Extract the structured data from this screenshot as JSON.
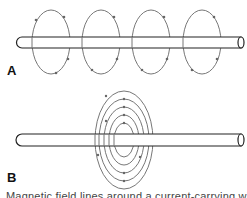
{
  "figure": {
    "panel_a": {
      "label": "A",
      "description": "Straight wire with four separate circular magnetic field loops spaced along its length",
      "loop_count": 4
    },
    "panel_b": {
      "label": "B",
      "description": "Straight wire with concentric magnetic field loops centered at one point",
      "loop_count": 5
    },
    "caption": "Magnetic field lines around a current-carrying wire",
    "colors": {
      "wire_stroke": "#222222",
      "field_line": "#777777",
      "arrow": "#666666",
      "background": "#ffffff"
    }
  }
}
